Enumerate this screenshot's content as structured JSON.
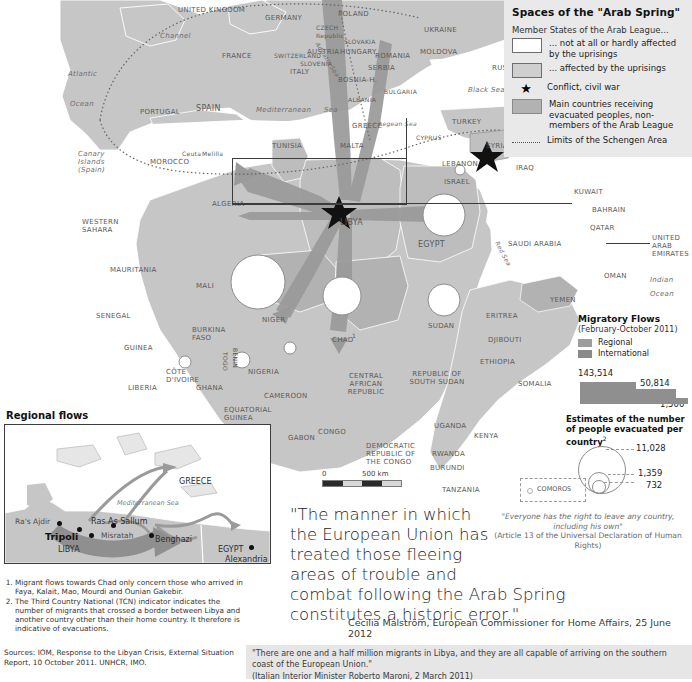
{
  "legend": {
    "title": "Spaces of the \"Arab Spring\"",
    "subtitle": "Member States of the Arab League...",
    "items": [
      {
        "swatch": "white",
        "label": "... not at all or hardly affected by the uprisings"
      },
      {
        "swatch": "gray",
        "label": "... affected by the uprisings"
      },
      {
        "swatch": "star",
        "label": "Conflict, civil war"
      },
      {
        "swatch": "dark",
        "label": "Main countries receiving evacuated peoples, non-members of the Arab League"
      },
      {
        "swatch": "dotted-line",
        "label": "Limits of the Schengen Area"
      }
    ]
  },
  "flows": {
    "title": "Migratory Flows",
    "period": "(February-October 2011)",
    "keys": [
      {
        "label": "Regional",
        "color": "#9d9d9d"
      },
      {
        "label": "International",
        "color": "#8a8a8a"
      }
    ],
    "bars": [
      {
        "value": "143,514"
      },
      {
        "value": "50,814"
      },
      {
        "value": "< 1,500"
      }
    ]
  },
  "estimates": {
    "title": "Estimates of the number of people evacuated per country",
    "footnote_marker": "2",
    "circles": [
      {
        "value": "11,028"
      },
      {
        "value": "1,359"
      },
      {
        "value": "732"
      }
    ]
  },
  "scale": {
    "zero": "0",
    "distance": "500 km"
  },
  "inset": {
    "title": "Regional flows",
    "labels": [
      "Ra's Ajdir",
      "Tripoli",
      "Ras As Sallum",
      "Misratah",
      "Benghazi",
      "Alexandria",
      "GREECE",
      "LIBYA",
      "EGYPT",
      "Mediterranean Sea"
    ]
  },
  "comoros": {
    "label": "COMOROS"
  },
  "map_labels": {
    "europe": [
      "UNITED KINGDOM",
      "GERMANY",
      "POLAND",
      "UKRAINE",
      "FRANCE",
      "SWITZERLAND",
      "AUSTRIA",
      "HUNGARY",
      "CZECH Republic",
      "SLOVAKIA",
      "SLOVENIA",
      "ROMANIA",
      "MOLDOVA",
      "SERBIA",
      "BOSNIA-H.",
      "BULGARIA",
      "ALBANIA",
      "ITALY",
      "GREECE",
      "PORTUGAL",
      "SPAIN",
      "RUSSIA",
      "TURKEY",
      "MALTA",
      "CYPRUS"
    ],
    "seas": [
      "Atlantic",
      "Ocean",
      "Channel",
      "Mediterranean",
      "Sea",
      "Black Sea",
      "Aegean Sea",
      "Adriatic Sea",
      "Red Sea",
      "Indian",
      "Ocean"
    ],
    "africa": [
      "MOROCCO",
      "Ceuta",
      "Melilla",
      "Canary Islands (Spain)",
      "WESTERN SAHARA",
      "ALGERIA",
      "TUNISIA",
      "LIBYA",
      "EGYPT",
      "MAURITANIA",
      "MALI",
      "NIGER",
      "SENEGAL",
      "GUINEA",
      "BURKINA FASO",
      "CÔTE D'IVOIRE",
      "GHANA",
      "LIBERIA",
      "TOGO",
      "BENIN",
      "NIGERIA",
      "CAMEROON",
      "CHAD",
      "SUDAN",
      "CENTRAL AFRICAN REPUBLIC",
      "REPUBLIC OF SOUTH SUDAN",
      "EQUATORIAL GUINEA",
      "GABON",
      "CONGO",
      "DEMOCRATIC REPUBLIC OF THE CONGO",
      "UGANDA",
      "RWANDA",
      "BURUNDI",
      "KENYA",
      "TANZANIA",
      "ETHIOPIA",
      "ERITREA",
      "DJIBOUTI",
      "SOMALIA"
    ],
    "middle_east": [
      "SYRIA",
      "LEBANON",
      "ISRAEL",
      "IRAQ",
      "KUWAIT",
      "BAHRAIN",
      "QATAR",
      "SAUDI ARABIA",
      "UNITED ARAB EMIRATES",
      "OMAN",
      "YEMEN"
    ],
    "chad_marker": "1"
  },
  "notes": {
    "items": [
      "Migrant flows towards Chad only concern those who arrived in Faya, Kalait, Mao, Mourdi and Ounian Gakebir.",
      "The Third Country National (TCN) indicator indicates the number of migrants that crossed a border between Libya and another country other than their home country. It therefore is indicative of evacuations."
    ],
    "sources": "Sources: IOM, Response to the Libyan Crisis, External Situation Report, 10 October 2011. UNHCR, IMO."
  },
  "quote": {
    "lines": [
      "\"The manner in which",
      "the European Union has",
      "treated those fleeing",
      "areas of trouble and",
      "combat following the Arab Spring",
      "constitutes a historic error.\""
    ],
    "attribution": "Cecilia Malström, European Commissioner for Home Affairs, 25 June 2012"
  },
  "udhr": {
    "quote": "\"Everyone has the right to leave any country, including his own\"",
    "source": "(Article 13 of the Universal Declaration of Human Rights)"
  },
  "maroni": {
    "quote": "\"There are one and a half million migrants in Libya, and they are all capable of arriving on the southern coast of the European Union.\"",
    "source": "(Italian Interior Minister Roberto Maroni, 2 March 2011)"
  },
  "colors": {
    "arab_affected": "#cfcfcf",
    "receiving": "#b2b2b2",
    "flow_arrow": "#9a9a9a",
    "land": "#c8c8c8",
    "sea": "#ffffff",
    "legend_bg": "#e9e9e9"
  }
}
